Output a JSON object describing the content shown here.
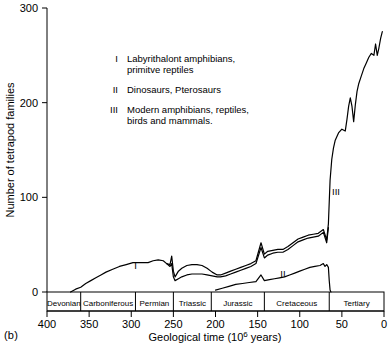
{
  "figure": {
    "panel_label": "(b)"
  },
  "chart_data": {
    "type": "line",
    "title": "",
    "subtitle": "",
    "xlabel": "Geological time (10⁶ years)",
    "xlabel_parts": {
      "before": "Geological time (10",
      "exponent": "6",
      "after": " years)"
    },
    "ylabel": "Number of tetrapod families",
    "xlim": [
      400,
      0
    ],
    "ylim": [
      0,
      300
    ],
    "x_reversed": true,
    "grid": false,
    "legend_position": "upper-center-inside",
    "xticks": [
      400,
      350,
      300,
      250,
      200,
      150,
      100,
      50,
      0
    ],
    "xtick_labels": [
      "400",
      "350",
      "300",
      "250",
      "200",
      "150",
      "100",
      "50",
      "0"
    ],
    "yticks": [
      0,
      100,
      200,
      300
    ],
    "ytick_labels": [
      "0",
      "100",
      "200",
      "300"
    ],
    "legend": [
      {
        "marker": "I",
        "lines": [
          "Labyrithalont amphibians,",
          "primitve reptiles"
        ]
      },
      {
        "marker": "II",
        "lines": [
          "Dinosaurs, Pterosaurs"
        ]
      },
      {
        "marker": "III",
        "lines": [
          "Modern amphibians, reptiles,",
          "birds and mammals."
        ]
      }
    ],
    "annotations": [
      {
        "text": "I",
        "x": 295,
        "y": 24
      },
      {
        "text": "II",
        "x": 120,
        "y": 16
      },
      {
        "text": "III",
        "x": 57,
        "y": 102
      }
    ],
    "geological_periods": [
      {
        "name": "Devonian",
        "start": 400,
        "end": 360
      },
      {
        "name": "Carboniferous",
        "start": 360,
        "end": 295
      },
      {
        "name": "Permian",
        "start": 295,
        "end": 250
      },
      {
        "name": "Triassic",
        "start": 250,
        "end": 205
      },
      {
        "name": "Jurassic",
        "start": 205,
        "end": 142
      },
      {
        "name": "Cretaceous",
        "start": 142,
        "end": 65
      },
      {
        "name": "Tertiary",
        "start": 65,
        "end": 0
      }
    ],
    "series": [
      {
        "name": "Total tetrapod families",
        "points": [
          [
            372,
            0
          ],
          [
            366,
            3
          ],
          [
            360,
            5
          ],
          [
            354,
            9
          ],
          [
            348,
            12
          ],
          [
            342,
            15
          ],
          [
            336,
            18
          ],
          [
            330,
            21
          ],
          [
            322,
            24
          ],
          [
            314,
            27
          ],
          [
            306,
            29
          ],
          [
            298,
            31
          ],
          [
            292,
            31
          ],
          [
            286,
            31
          ],
          [
            280,
            31
          ],
          [
            274,
            33
          ],
          [
            268,
            34
          ],
          [
            262,
            33
          ],
          [
            258,
            30
          ],
          [
            254,
            29
          ],
          [
            252,
            38
          ],
          [
            250,
            22
          ],
          [
            248,
            16
          ],
          [
            244,
            22
          ],
          [
            240,
            25
          ],
          [
            234,
            28
          ],
          [
            228,
            29
          ],
          [
            222,
            29
          ],
          [
            216,
            28
          ],
          [
            210,
            25
          ],
          [
            204,
            21
          ],
          [
            198,
            18
          ],
          [
            194,
            18
          ],
          [
            188,
            20
          ],
          [
            182,
            22
          ],
          [
            176,
            24
          ],
          [
            170,
            26
          ],
          [
            164,
            28
          ],
          [
            158,
            30
          ],
          [
            152,
            33
          ],
          [
            146,
            52
          ],
          [
            142,
            40
          ],
          [
            138,
            43
          ],
          [
            132,
            44
          ],
          [
            126,
            45
          ],
          [
            120,
            45
          ],
          [
            114,
            48
          ],
          [
            108,
            52
          ],
          [
            102,
            56
          ],
          [
            96,
            58
          ],
          [
            90,
            60
          ],
          [
            84,
            61
          ],
          [
            78,
            62
          ],
          [
            72,
            66
          ],
          [
            68,
            55
          ],
          [
            66,
            72
          ],
          [
            64,
            118
          ],
          [
            62,
            140
          ],
          [
            60,
            152
          ],
          [
            58,
            160
          ],
          [
            54,
            168
          ],
          [
            50,
            172
          ],
          [
            46,
            170
          ],
          [
            44,
            182
          ],
          [
            42,
            196
          ],
          [
            40,
            205
          ],
          [
            38,
            196
          ],
          [
            36,
            180
          ],
          [
            34,
            198
          ],
          [
            32,
            212
          ],
          [
            30,
            220
          ],
          [
            27,
            228
          ],
          [
            24,
            236
          ],
          [
            21,
            242
          ],
          [
            18,
            248
          ],
          [
            15,
            252
          ],
          [
            12,
            250
          ],
          [
            10,
            262
          ],
          [
            8,
            250
          ],
          [
            6,
            258
          ],
          [
            4,
            268
          ],
          [
            2,
            275
          ]
        ]
      },
      {
        "name": "Lower component curve",
        "points": [
          [
            258,
            30
          ],
          [
            254,
            27
          ],
          [
            252,
            30
          ],
          [
            250,
            16
          ],
          [
            248,
            12
          ],
          [
            244,
            14
          ],
          [
            240,
            16
          ],
          [
            234,
            18
          ],
          [
            228,
            19
          ],
          [
            222,
            19
          ],
          [
            216,
            19
          ],
          [
            210,
            18
          ],
          [
            204,
            17
          ],
          [
            198,
            16
          ],
          [
            194,
            16
          ],
          [
            188,
            17
          ],
          [
            182,
            19
          ],
          [
            176,
            21
          ],
          [
            170,
            23
          ],
          [
            164,
            25
          ],
          [
            158,
            27
          ],
          [
            152,
            30
          ],
          [
            146,
            47
          ],
          [
            142,
            36
          ],
          [
            138,
            39
          ],
          [
            132,
            41
          ],
          [
            126,
            42
          ],
          [
            120,
            42
          ],
          [
            114,
            45
          ],
          [
            108,
            49
          ],
          [
            102,
            53
          ],
          [
            96,
            55
          ],
          [
            90,
            57
          ],
          [
            84,
            58
          ],
          [
            78,
            59
          ],
          [
            72,
            63
          ],
          [
            68,
            52
          ],
          [
            66,
            68
          ]
        ]
      },
      {
        "name": "Dinosaurs and Pterosaurs (II)",
        "points": [
          [
            200,
            2
          ],
          [
            192,
            4
          ],
          [
            184,
            6
          ],
          [
            176,
            8
          ],
          [
            168,
            9
          ],
          [
            160,
            10
          ],
          [
            152,
            11
          ],
          [
            146,
            18
          ],
          [
            142,
            12
          ],
          [
            136,
            13
          ],
          [
            130,
            14
          ],
          [
            124,
            15
          ],
          [
            118,
            16
          ],
          [
            112,
            18
          ],
          [
            106,
            20
          ],
          [
            100,
            22
          ],
          [
            94,
            24
          ],
          [
            88,
            26
          ],
          [
            82,
            27
          ],
          [
            76,
            28
          ],
          [
            72,
            30
          ],
          [
            70,
            27
          ],
          [
            68,
            29
          ],
          [
            66,
            26
          ],
          [
            65,
            12
          ],
          [
            64,
            2
          ],
          [
            63,
            0
          ]
        ]
      }
    ]
  }
}
